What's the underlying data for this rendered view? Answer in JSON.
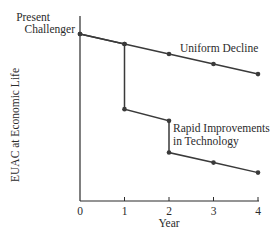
{
  "chart_data": {
    "type": "line",
    "title": "",
    "xlabel": "Year",
    "ylabel": "EUAC at Economic Life",
    "x_ticks": [
      "0",
      "1",
      "2",
      "3",
      "4"
    ],
    "xlim": [
      0,
      4
    ],
    "ylim": [
      0,
      100
    ],
    "y_ticks": [],
    "grid": false,
    "units_note": "relative EUAC (y-axis unlabeled)",
    "start_label": [
      "Present",
      "Challenger"
    ],
    "series": [
      {
        "name": "Uniform Decline",
        "label": "Uniform Decline",
        "points": [
          {
            "x": 0,
            "y": 100
          },
          {
            "x": 1,
            "y": 94
          },
          {
            "x": 2,
            "y": 88
          },
          {
            "x": 3,
            "y": 82
          },
          {
            "x": 4,
            "y": 76
          }
        ]
      },
      {
        "name": "Rapid Improvements in Technology",
        "label": [
          "Rapid Improvements",
          "in Technology"
        ],
        "points": [
          {
            "x": 0,
            "y": 100
          },
          {
            "x": 1,
            "y": 94
          },
          {
            "x": 1,
            "y": 55
          },
          {
            "x": 2,
            "y": 48
          },
          {
            "x": 2,
            "y": 29
          },
          {
            "x": 3,
            "y": 23
          },
          {
            "x": 4,
            "y": 17
          }
        ]
      }
    ],
    "colors": {
      "line": "#3a3a3a",
      "marker": "#3a3a3a",
      "axis": "#2b2b2b"
    }
  }
}
